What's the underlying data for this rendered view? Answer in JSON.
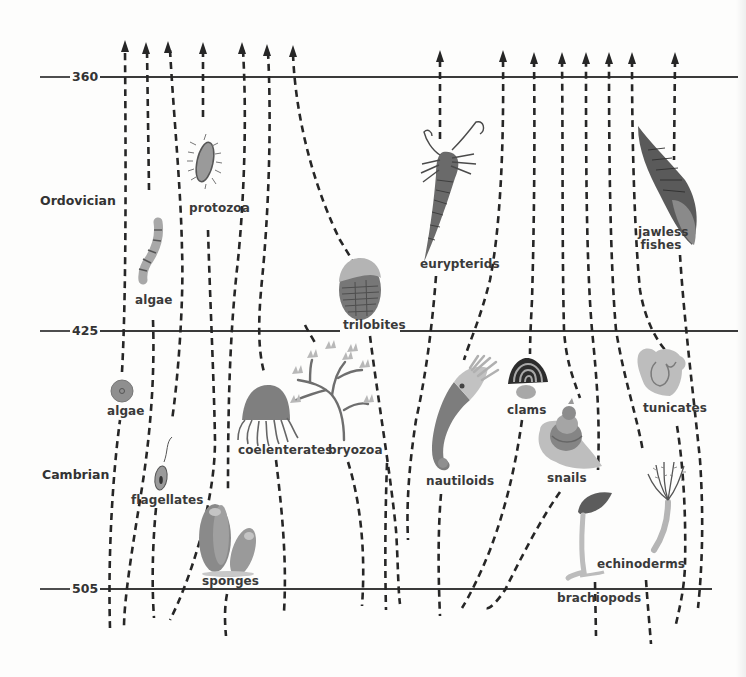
{
  "diagram": {
    "type": "evolutionary-timeline",
    "time_marks": [
      {
        "label": "360",
        "y": 77
      },
      {
        "label": "425",
        "y": 331
      },
      {
        "label": "505",
        "y": 589
      }
    ],
    "periods": [
      {
        "label": "Ordovician"
      },
      {
        "label": "Cambrian"
      }
    ],
    "organisms": [
      {
        "id": "algae-ordovician",
        "label": "algae"
      },
      {
        "id": "protozoa",
        "label": "protozoa"
      },
      {
        "id": "trilobites",
        "label": "trilobites"
      },
      {
        "id": "eurypterids",
        "label": "eurypterids"
      },
      {
        "id": "jawless-fishes",
        "label_line1": "jawless",
        "label_line2": "fishes"
      },
      {
        "id": "algae-cambrian",
        "label": "algae"
      },
      {
        "id": "flagellates",
        "label": "flagellates"
      },
      {
        "id": "coelenterates",
        "label": "coelenterates"
      },
      {
        "id": "bryozoa",
        "label": "bryozoa"
      },
      {
        "id": "sponges",
        "label": "sponges"
      },
      {
        "id": "nautiloids",
        "label": "nautiloids"
      },
      {
        "id": "clams",
        "label": "clams"
      },
      {
        "id": "snails",
        "label": "snails"
      },
      {
        "id": "tunicates",
        "label": "tunicates"
      },
      {
        "id": "echinoderms",
        "label": "echinoderms"
      },
      {
        "id": "brachiopods",
        "label": "brachiopods"
      }
    ],
    "colors": {
      "line": "#262626",
      "text": "#3a3a3a",
      "organism_gray": "#8a8a8a",
      "organism_light": "#b8b8b8",
      "background": "#fdfdfc"
    }
  }
}
